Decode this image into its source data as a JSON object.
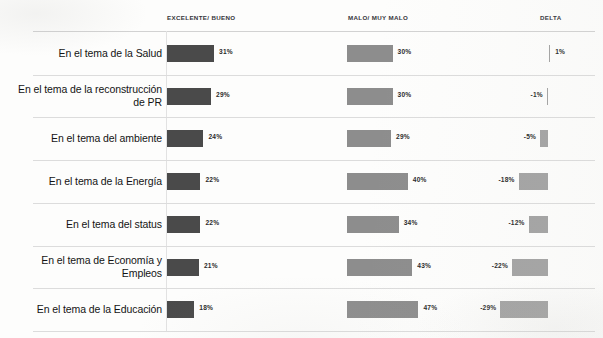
{
  "chart_data": {
    "type": "bar",
    "title": "",
    "subtitle": "",
    "xlabel": "",
    "ylabel": "",
    "grid": false,
    "legend_position": "top",
    "orientation": "horizontal",
    "categories": [
      "En el tema de la Salud",
      "En el tema de la reconstrucción de PR",
      "En el tema del ambiente",
      "En el tema de la Energía",
      "En el tema del status",
      "En el tema de Economía y Empleos",
      "En el tema de la Educación"
    ],
    "series": [
      {
        "name": "EXCELENTE/ BUENO",
        "values": [
          31,
          29,
          24,
          22,
          22,
          21,
          18
        ],
        "labels": [
          "31%",
          "29%",
          "24%",
          "22%",
          "22%",
          "21%",
          "18%"
        ],
        "color": "#4a4a4a"
      },
      {
        "name": "MALO/ MUY MALO",
        "values": [
          30,
          30,
          29,
          40,
          34,
          43,
          47
        ],
        "labels": [
          "30%",
          "30%",
          "29%",
          "40%",
          "34%",
          "43%",
          "47%"
        ],
        "color": "#8d8d8d"
      },
      {
        "name": "DELTA",
        "values": [
          1,
          -1,
          -5,
          -18,
          -12,
          -22,
          -29
        ],
        "labels": [
          "1%",
          "-1%",
          "-5%",
          "-18%",
          "-12%",
          "-22%",
          "-29%"
        ],
        "color": "#a3a3a3"
      }
    ],
    "xlim": [
      0,
      50
    ],
    "delta_axis_zero": true
  },
  "headers": {
    "excelente": "EXCELENTE/ BUENO",
    "malo": "MALO/ MUY MALO",
    "delta": "DELTA"
  },
  "rows": [
    {
      "label": "En el tema de la Salud",
      "pos_value": "31%",
      "neg_value": "30%",
      "delta_value": "1%"
    },
    {
      "label": "En el tema de la reconstrucción de PR",
      "pos_value": "29%",
      "neg_value": "30%",
      "delta_value": "-1%"
    },
    {
      "label": "En el tema del ambiente",
      "pos_value": "24%",
      "neg_value": "29%",
      "delta_value": "-5%"
    },
    {
      "label": "En el tema de la Energía",
      "pos_value": "22%",
      "neg_value": "40%",
      "delta_value": "-18%"
    },
    {
      "label": "En el tema del status",
      "pos_value": "22%",
      "neg_value": "34%",
      "delta_value": "-12%"
    },
    {
      "label": "En el tema de Economía y Empleos",
      "pos_value": "21%",
      "neg_value": "43%",
      "delta_value": "-22%"
    },
    {
      "label": "En el tema de la Educación",
      "pos_value": "18%",
      "neg_value": "47%",
      "delta_value": "-29%"
    }
  ],
  "colors": {
    "positive_bar": "#4a4a4a",
    "negative_bar": "#8d8d8d",
    "delta_bar": "#a3a3a3",
    "separator": "#dcdcdc",
    "background": "#fdfdfc"
  }
}
